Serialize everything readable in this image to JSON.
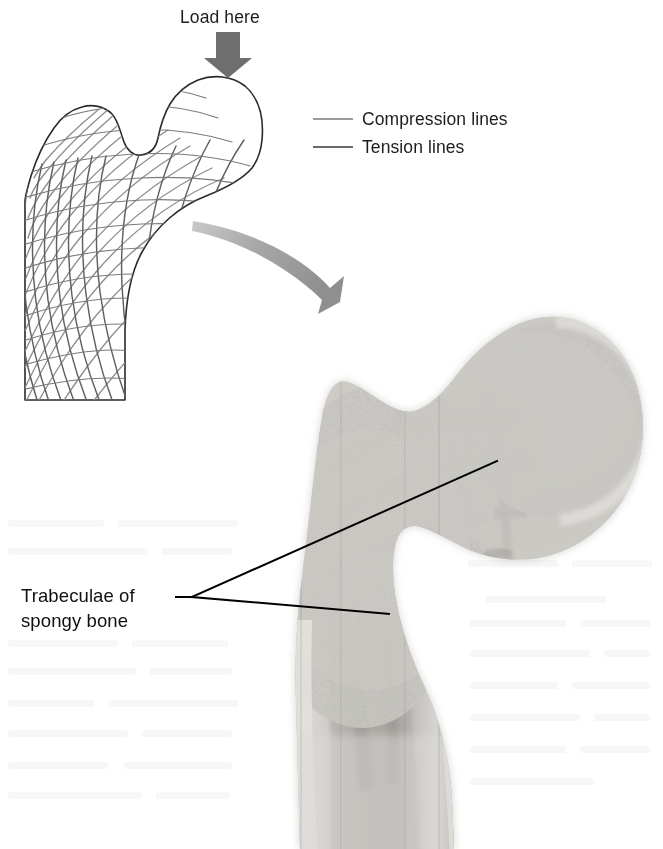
{
  "figure": {
    "title_text": "Load here",
    "legend": {
      "items": [
        {
          "label": "Compression lines",
          "swatch": "line-swatch-light",
          "color": "#9b9b9b"
        },
        {
          "label": "Tension lines",
          "swatch": "line-swatch-dark",
          "color": "#6a6a6a"
        }
      ]
    },
    "callout": {
      "line1": "Trabeculae of",
      "line2": "spongy bone"
    },
    "icons": {
      "load_arrow": "down-block-arrow-icon",
      "transition_arrow": "curved-right-arrow-icon"
    },
    "colors": {
      "load_arrow": "#6e6e6e",
      "curved_arrow": "#9a9a9a",
      "diagram_outline": "#2a2a2a",
      "compression_mesh": "#8d8d8d",
      "tension_mesh": "#5f5f5f",
      "leader_line": "#000000",
      "photo_bone_light": "#d8d6d2",
      "photo_bone_mid": "#b9b7b2",
      "photo_bone_dark": "#8e8c88",
      "background": "#ffffff"
    },
    "panels": {
      "schematic_label": "proximal-femur-trabecular-schematic",
      "photo_label": "proximal-femur-frontal-section-photograph"
    }
  }
}
